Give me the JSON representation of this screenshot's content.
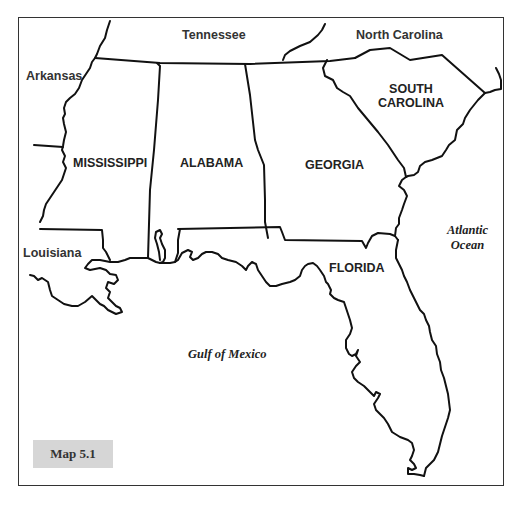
{
  "map": {
    "title_box": "Map 5.1",
    "states": {
      "mississippi": "MISSISSIPPI",
      "alabama": "ALABAMA",
      "georgia": "GEORGIA",
      "south_carolina_line1": "SOUTH",
      "south_carolina_line2": "CAROLINA",
      "florida": "FLORIDA"
    },
    "neighbors": {
      "tennessee": "Tennessee",
      "north_carolina": "North Carolina",
      "arkansas": "Arkansas",
      "louisiana": "Louisiana"
    },
    "water": {
      "gulf": "Gulf of Mexico",
      "atlantic_line1": "Atlantic",
      "atlantic_line2": "Ocean"
    },
    "colors": {
      "border": "#111111",
      "frame": "#333333",
      "label_box_bg": "#d6d6d6",
      "background": "#ffffff"
    }
  }
}
